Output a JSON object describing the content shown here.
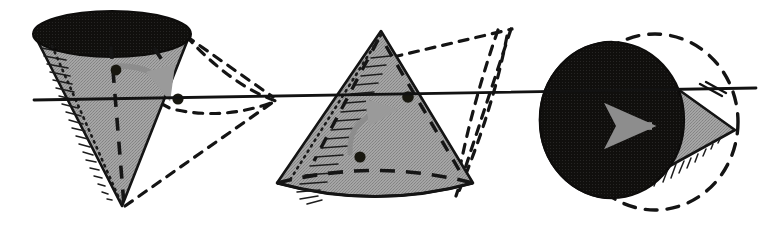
{
  "figure": {
    "background_color": "#ffffff",
    "width": 772,
    "height": 230,
    "colors": {
      "ink": "#1a1a1a",
      "cone_fill_grey": "#9b9b9b",
      "solid_black": "#100f0d",
      "arrow_grey": "#8d8d8d",
      "ghost_outline": "#141414",
      "axis": "#121212"
    },
    "axis": {
      "name": "horizontal-axis-line",
      "label": "axis of rotation",
      "x1": 34,
      "y1": 100,
      "x2": 756,
      "y2": 88,
      "stroke_width": 2.6
    },
    "panels": [
      {
        "id": "panel-left",
        "label": "Cone in first orientation (apex down)",
        "cone": {
          "name": "cone-inverted",
          "apex": {
            "x": 122,
            "y": 206
          },
          "base_center": {
            "x": 112,
            "y": 34
          },
          "base_rx": 78,
          "base_ry": 22,
          "fill": "#9b9b9b",
          "base_face_fill": "#100f0d",
          "base_face_label": "visible black elliptical base"
        },
        "markers": [
          {
            "name": "dot-upper",
            "x": 116,
            "y": 70,
            "r": 5.2
          },
          {
            "name": "dot-on-axis",
            "x": 178,
            "y": 99,
            "r": 5.4
          }
        ],
        "arrow": {
          "name": "rotation-arrow-curved",
          "kind": "curved",
          "direction": "clockwise",
          "color": "#8d8d8d",
          "from": {
            "x": 122,
            "y": 66
          },
          "to": {
            "x": 170,
            "y": 95
          }
        },
        "ghost": {
          "name": "ghost-cone-outline",
          "style": "dash-dot",
          "label": "dash-dot ghost of rotated cone"
        },
        "hatching": {
          "name": "edge-hatching",
          "side": "left"
        },
        "hidden_edges": {
          "name": "hidden-axis-dashes",
          "style": "dashed"
        }
      },
      {
        "id": "panel-middle",
        "label": "Cone in second orientation (apex up)",
        "cone": {
          "name": "cone-upright",
          "apex": {
            "x": 381,
            "y": 31
          },
          "base_center": {
            "x": 375,
            "y": 183
          },
          "base_rx": 98,
          "base_ry": 24,
          "fill": "#9b9b9b",
          "base_face_fill": "none",
          "base_face_label": "dashed hidden elliptical base"
        },
        "markers": [
          {
            "name": "dot-lower",
            "x": 360,
            "y": 157,
            "r": 5.2
          },
          {
            "name": "dot-on-axis",
            "x": 408,
            "y": 97,
            "r": 5.4
          }
        ],
        "arrow": {
          "name": "rotation-arrow-curved",
          "kind": "curved",
          "direction": "counter-clockwise",
          "color": "#8d8d8d",
          "from": {
            "x": 353,
            "y": 150
          },
          "to": {
            "x": 398,
            "y": 112
          }
        },
        "ghost": {
          "name": "ghost-cone-outline",
          "style": "dash-dot",
          "label": "dash-dot ghost of rotated cone"
        },
        "hatching": {
          "name": "edge-hatching",
          "side": "left"
        },
        "hidden_edges": {
          "name": "hidden-axis-dashes",
          "style": "dashed"
        }
      },
      {
        "id": "panel-right",
        "label": "Cone in third orientation (base toward viewer)",
        "cone": {
          "name": "cone-end-on",
          "apex": {
            "x": 735,
            "y": 130
          },
          "base_center": {
            "x": 612,
            "y": 120
          },
          "base_rx": 72,
          "base_ry": 78,
          "fill": "#9b9b9b",
          "base_face_fill": "#100f0d",
          "base_face_label": "black circular base facing viewer"
        },
        "markers": [],
        "arrow": {
          "name": "translation-arrow-straight",
          "kind": "straight",
          "direction": "right",
          "color": "#8d8d8d",
          "from": {
            "x": 618,
            "y": 126
          },
          "to": {
            "x": 660,
            "y": 126
          }
        },
        "ghost": {
          "name": "ghost-circle-outline",
          "style": "dashed",
          "label": "dashed circular ghost outline"
        },
        "hatching": {
          "name": "edge-hatching",
          "side": "lower"
        },
        "hidden_edges": {
          "name": "hidden-axis-dashes",
          "style": "dashed"
        }
      }
    ]
  }
}
